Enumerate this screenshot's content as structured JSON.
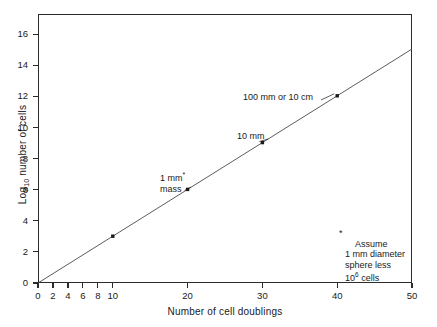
{
  "chart_data": {
    "type": "line",
    "title": "",
    "xlabel": "Number of cell doublings",
    "ylabel": "Log10 number of cells",
    "ylabel_base": "Log",
    "ylabel_sub": "10",
    "ylabel_rest": " number of cells",
    "xlim": [
      0,
      50
    ],
    "ylim": [
      0,
      17.3
    ],
    "grid": false,
    "legend": "none",
    "xticks": [
      0,
      2,
      4,
      6,
      8,
      10,
      20,
      30,
      40,
      50
    ],
    "xticklabels": [
      "0",
      "2",
      "4",
      "6",
      "8",
      "10",
      "20",
      "30",
      "40",
      "50"
    ],
    "yticks": [
      0,
      2,
      4,
      6,
      8,
      10,
      12,
      14,
      16
    ],
    "yticklabels": [
      "0",
      "2",
      "4",
      "6",
      "8",
      "10",
      "12",
      "14",
      "16"
    ],
    "series": [
      {
        "name": "log10 cells vs doublings",
        "x": [
          0,
          50
        ],
        "y": [
          0,
          15.05
        ],
        "slope": 0.301,
        "intercept": 0
      }
    ],
    "points": [
      {
        "x": 10,
        "y": 3.01,
        "label": ""
      },
      {
        "x": 20,
        "y": 6.02,
        "label": "1 mm* mass"
      },
      {
        "x": 30,
        "y": 9.03,
        "label": "10 mm"
      },
      {
        "x": 40,
        "y": 12.04,
        "label": "100 mm or 10 cm"
      }
    ],
    "annotations": [
      {
        "id": "a100mm",
        "text": "100 mm or 10 cm",
        "x": 40,
        "y": 12.04
      },
      {
        "id": "a10mm",
        "text": "10 mm",
        "x": 30,
        "y": 9.03
      },
      {
        "id": "a1mm_line1",
        "text": "1 mm",
        "x": 20,
        "y": 6.02
      },
      {
        "id": "a1mm_line2",
        "text": "mass",
        "x": 20,
        "y": 6.02
      }
    ],
    "footnote": {
      "marker": "*",
      "line1": "Assume",
      "line2": "1 mm diameter",
      "line3": "sphere less",
      "line4_base": "10",
      "line4_exp": "6",
      "line4_rest": " cells"
    },
    "colors": {
      "line": "#4a4a4a",
      "axis": "#2b2b2b",
      "marker": "#1a1a1a",
      "text": "#1a1a1a",
      "background": "#ffffff"
    }
  }
}
